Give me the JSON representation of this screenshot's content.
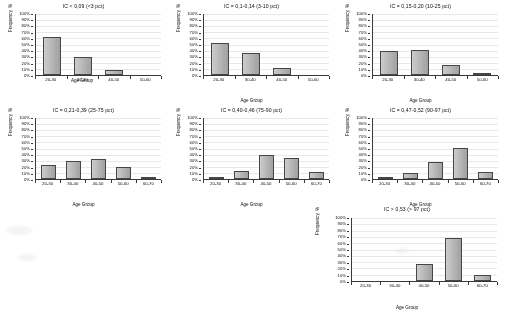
{
  "figure": {
    "axis_labels": {
      "y": "Frequency, %",
      "x": "Age Group"
    },
    "y_ticks": [
      "100%",
      "90%",
      "80%",
      "70%",
      "60%",
      "50%",
      "40%",
      "30%",
      "20%",
      "10%",
      "0%"
    ],
    "bar_color": "#a8a8a8",
    "bar_border_color": "#4a4a4a",
    "grid_color": "#e0e0e0"
  },
  "chart_data": [
    {
      "type": "bar",
      "title": "IC < 0,09 (<3 pct)",
      "categories": [
        "20-30",
        "30-40",
        "40-50",
        "50-60"
      ],
      "values": [
        63,
        29,
        8,
        0
      ],
      "xlabel": "Age Group",
      "ylabel": "Frequency, %",
      "ylim": [
        0,
        100
      ],
      "grid": true,
      "legend": "none"
    },
    {
      "type": "bar",
      "title": "IC = 0,1-0,14 (3-10 pct)",
      "categories": [
        "20-30",
        "30-40",
        "40-50",
        "50-60"
      ],
      "values": [
        52,
        36,
        12,
        0
      ],
      "xlabel": "Age Group",
      "ylabel": "Frequency, %",
      "ylim": [
        0,
        100
      ],
      "grid": true,
      "legend": "none"
    },
    {
      "type": "bar",
      "title": "IC = 0,15-0,20 (10-25 pct)",
      "categories": [
        "20-30",
        "30-40",
        "40-50",
        "50-60"
      ],
      "values": [
        39,
        41,
        16,
        3
      ],
      "xlabel": "Age Group",
      "ylabel": "Frequency, %",
      "ylim": [
        0,
        100
      ],
      "grid": true,
      "legend": "none"
    },
    {
      "type": "bar",
      "title": "IC = 0,21-0,39 (25-75 pct)",
      "categories": [
        "20-30",
        "30-40",
        "40-50",
        "50-60",
        "60-70"
      ],
      "values": [
        23,
        29,
        32,
        20,
        2
      ],
      "xlabel": "Age Group",
      "ylabel": "Frequency, %",
      "ylim": [
        0,
        100
      ],
      "grid": true,
      "legend": "none"
    },
    {
      "type": "bar",
      "title": "IC = 0,40-0,46 (75-90 pct)",
      "categories": [
        "20-30",
        "30-40",
        "40-50",
        "50-60",
        "60-70"
      ],
      "values": [
        3,
        13,
        39,
        34,
        11
      ],
      "xlabel": "Age Group",
      "ylabel": "Frequency, %",
      "ylim": [
        0,
        100
      ],
      "grid": true,
      "legend": "none"
    },
    {
      "type": "bar",
      "title": "IC = 0,47-0,52 (90-97 pct)",
      "categories": [
        "20-30",
        "30-40",
        "40-50",
        "50-60",
        "60-70"
      ],
      "values": [
        4,
        10,
        28,
        51,
        12
      ],
      "xlabel": "Age Group",
      "ylabel": "Frequency, %",
      "ylim": [
        0,
        100
      ],
      "grid": true,
      "legend": "none"
    },
    {
      "type": "bar",
      "title": "IC > 0,53 (> 97 pct)",
      "categories": [
        "20-30",
        "30-40",
        "40-50",
        "50-60",
        "60-70"
      ],
      "values": [
        0,
        0,
        27,
        68,
        10
      ],
      "xlabel": "Age Group",
      "ylabel": "Frequency, %",
      "ylim": [
        0,
        100
      ],
      "grid": true,
      "legend": "none"
    }
  ]
}
